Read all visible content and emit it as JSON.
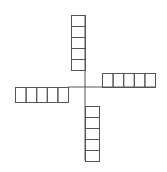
{
  "diagram": {
    "line_color": "#555555",
    "background": "#ffffff",
    "center": {
      "x": 85,
      "y": 87
    },
    "arms": [
      {
        "name": "top",
        "orientation": "vertical",
        "x": 71,
        "y": 15,
        "cell_w": 14,
        "cell_h": 11,
        "count": 5
      },
      {
        "name": "right",
        "orientation": "horizontal",
        "x": 102,
        "y": 73,
        "cell_w": 10.6,
        "cell_h": 14,
        "count": 5
      },
      {
        "name": "left",
        "orientation": "horizontal",
        "x": 15,
        "y": 87,
        "cell_w": 10.6,
        "cell_h": 15,
        "count": 5
      },
      {
        "name": "bottom",
        "orientation": "vertical",
        "x": 85,
        "y": 106,
        "cell_w": 14,
        "cell_h": 11,
        "count": 5
      }
    ]
  }
}
